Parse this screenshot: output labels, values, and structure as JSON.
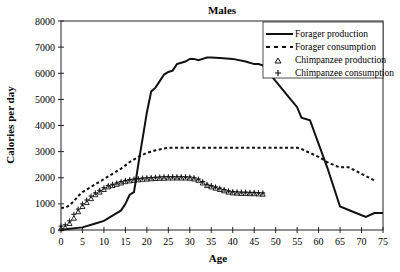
{
  "chart_data": {
    "type": "line",
    "title": "Males",
    "xlabel": "Age",
    "ylabel": "Calories per day",
    "xlim": [
      0,
      75
    ],
    "ylim": [
      0,
      8000
    ],
    "xticks": [
      0,
      5,
      10,
      15,
      20,
      25,
      30,
      35,
      40,
      45,
      50,
      55,
      60,
      65,
      70,
      75
    ],
    "yticks": [
      0,
      1000,
      2000,
      3000,
      4000,
      5000,
      6000,
      7000,
      8000
    ],
    "grid": false,
    "legend_position": "top-right",
    "series": [
      {
        "name": "Forager production",
        "style": "solid",
        "x": [
          0,
          2,
          5,
          8,
          10,
          12,
          14,
          15,
          16,
          17,
          18,
          19,
          20,
          21,
          22,
          23,
          24,
          25,
          26,
          27,
          28,
          29,
          30,
          31,
          32,
          33,
          34,
          35,
          37,
          40,
          43,
          45,
          46,
          47,
          50,
          53,
          55,
          56,
          58,
          60,
          62,
          65,
          68,
          71,
          73,
          75
        ],
        "y": [
          0,
          50,
          100,
          250,
          350,
          550,
          750,
          1000,
          1350,
          1450,
          2500,
          3500,
          4500,
          5300,
          5450,
          5700,
          5950,
          6050,
          6100,
          6350,
          6400,
          6450,
          6550,
          6550,
          6500,
          6550,
          6600,
          6600,
          6580,
          6550,
          6450,
          6350,
          6350,
          6300,
          5700,
          5100,
          4700,
          4300,
          4200,
          3300,
          2400,
          900,
          700,
          500,
          650,
          650
        ]
      },
      {
        "name": "Forager consumption",
        "style": "dashed",
        "x": [
          0,
          1,
          2,
          3,
          4,
          5,
          6,
          8,
          10,
          12,
          14,
          16,
          18,
          20,
          22,
          25,
          30,
          35,
          40,
          45,
          50,
          55,
          56,
          58,
          60,
          62,
          64,
          65,
          67,
          70,
          73
        ],
        "y": [
          850,
          850,
          950,
          1100,
          1300,
          1450,
          1550,
          1750,
          1950,
          2150,
          2350,
          2600,
          2800,
          2950,
          3050,
          3150,
          3150,
          3150,
          3150,
          3150,
          3150,
          3150,
          3100,
          2950,
          2800,
          2600,
          2450,
          2400,
          2400,
          2150,
          1900
        ]
      },
      {
        "name": "Chimpanzee production",
        "marker": "triangle",
        "x": [
          0,
          1,
          2,
          3,
          4,
          5,
          6,
          7,
          8,
          9,
          10,
          11,
          12,
          13,
          14,
          15,
          16,
          17,
          18,
          19,
          20,
          21,
          22,
          23,
          24,
          25,
          26,
          27,
          28,
          29,
          30,
          31,
          32,
          33,
          34,
          35,
          36,
          37,
          38,
          39,
          40,
          41,
          42,
          43,
          44,
          45,
          46,
          47
        ],
        "y": [
          50,
          100,
          250,
          450,
          700,
          900,
          1050,
          1200,
          1350,
          1450,
          1550,
          1650,
          1700,
          1750,
          1800,
          1850,
          1880,
          1900,
          1920,
          1940,
          1950,
          1960,
          1970,
          1980,
          1980,
          1990,
          1990,
          1990,
          1990,
          1990,
          1980,
          1950,
          1900,
          1800,
          1700,
          1650,
          1600,
          1550,
          1500,
          1450,
          1420,
          1410,
          1400,
          1400,
          1390,
          1390,
          1380,
          1370
        ]
      },
      {
        "name": "Chimpanzee consumption",
        "marker": "plus",
        "x": [
          0,
          1,
          2,
          3,
          4,
          5,
          6,
          7,
          8,
          9,
          10,
          11,
          12,
          13,
          14,
          15,
          16,
          17,
          18,
          19,
          20,
          21,
          22,
          23,
          24,
          25,
          26,
          27,
          28,
          29,
          30,
          31,
          32,
          33,
          34,
          35,
          36,
          37,
          38,
          39,
          40,
          41,
          42,
          43,
          44,
          45,
          46,
          47
        ],
        "y": [
          150,
          200,
          350,
          600,
          800,
          1000,
          1150,
          1300,
          1420,
          1520,
          1620,
          1700,
          1750,
          1800,
          1850,
          1900,
          1930,
          1950,
          1970,
          1990,
          2000,
          2010,
          2020,
          2030,
          2040,
          2040,
          2040,
          2040,
          2040,
          2040,
          2030,
          2000,
          1950,
          1850,
          1750,
          1700,
          1650,
          1600,
          1550,
          1500,
          1470,
          1460,
          1450,
          1450,
          1440,
          1440,
          1430,
          1420
        ]
      }
    ]
  }
}
